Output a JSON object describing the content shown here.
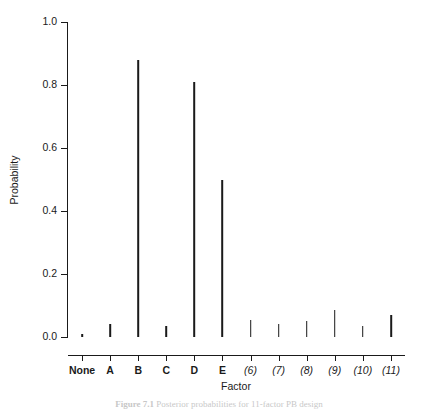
{
  "chart_data": {
    "type": "bar",
    "title": "",
    "xlabel": "Factor",
    "ylabel": "Probability",
    "categories": [
      "None",
      "A",
      "B",
      "C",
      "D",
      "E",
      "(6)",
      "(7)",
      "(8)",
      "(9)",
      "(10)",
      "(11)"
    ],
    "values": [
      0.01,
      0.04,
      0.88,
      0.035,
      0.81,
      0.5,
      0.055,
      0.04,
      0.05,
      0.085,
      0.035,
      0.07
    ],
    "ylim": [
      0.0,
      1.0
    ],
    "ytick_labels": [
      "0.0",
      "0.2",
      "0.4",
      "0.6",
      "0.8",
      "1.0"
    ],
    "ytick_values": [
      0.0,
      0.2,
      0.4,
      0.6,
      0.8,
      1.0
    ],
    "grid": false,
    "legend": null,
    "style": "needle-plot",
    "series_color": "#1a1a1a"
  },
  "caption": {
    "figure_label": "Figure 7.1",
    "text": "Posterior probabilities for 11-factor PB design"
  },
  "axis": {
    "y_title": "Probability",
    "x_title": "Factor"
  }
}
